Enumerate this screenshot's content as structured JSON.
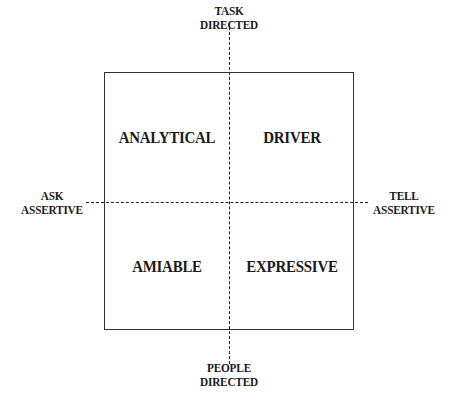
{
  "axes": {
    "top": [
      "TASK",
      "DIRECTED"
    ],
    "bottom": [
      "PEOPLE",
      "DIRECTED"
    ],
    "left": [
      "ASK",
      "ASSERTIVE"
    ],
    "right": [
      "TELL",
      "ASSERTIVE"
    ]
  },
  "quadrants": {
    "top_left": "ANALYTICAL",
    "top_right": "DRIVER",
    "bottom_left": "AMIABLE",
    "bottom_right": "EXPRESSIVE"
  }
}
